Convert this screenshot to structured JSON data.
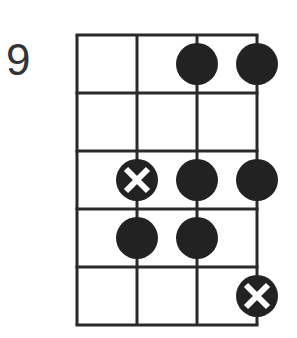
{
  "diagram": {
    "type": "fretboard",
    "start_fret_label": "9",
    "strings": 4,
    "frets": 5,
    "colors": {
      "line": "#2a2a2a",
      "dot": "#222222",
      "cross": "#ffffff"
    },
    "dots": [
      {
        "string": 3,
        "fret": 1,
        "type": "note"
      },
      {
        "string": 4,
        "fret": 1,
        "type": "note"
      },
      {
        "string": 2,
        "fret": 3,
        "type": "root"
      },
      {
        "string": 3,
        "fret": 3,
        "type": "note"
      },
      {
        "string": 4,
        "fret": 3,
        "type": "note"
      },
      {
        "string": 2,
        "fret": 4,
        "type": "note"
      },
      {
        "string": 3,
        "fret": 4,
        "type": "note"
      },
      {
        "string": 4,
        "fret": 5,
        "type": "root"
      }
    ]
  }
}
